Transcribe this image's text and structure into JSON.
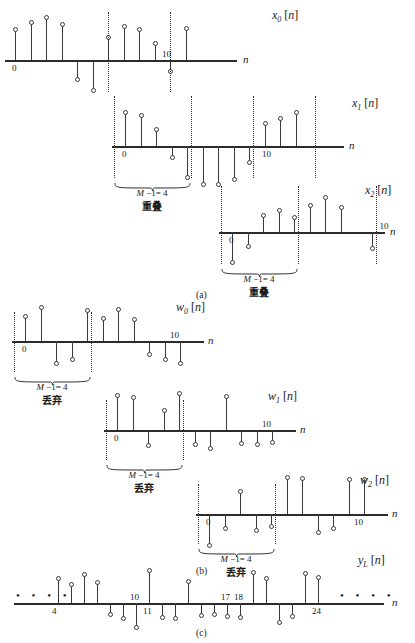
{
  "figure": {
    "axis_variable": "n",
    "parts": [
      {
        "id": "a",
        "label": "(a)"
      },
      {
        "id": "b",
        "label": "(b)"
      },
      {
        "id": "c",
        "label": "(c)"
      }
    ],
    "bracket_label": "M −1= 4",
    "overlap_text": "重叠",
    "discard_text": "丢弃"
  },
  "signals": {
    "x0": {
      "name": "x",
      "sub": "0",
      "arg": "[n]",
      "origin_tick": "0",
      "tick10": "10"
    },
    "x1": {
      "name": "x",
      "sub": "1",
      "arg": "[n]",
      "origin_tick": "0",
      "tick10": "10"
    },
    "x2": {
      "name": "x",
      "sub": "2",
      "arg": "[n]",
      "origin_tick": "0",
      "tick10": "10"
    },
    "w0": {
      "name": "w",
      "sub": "0",
      "arg": "[n]",
      "origin_tick": "0",
      "tick10": "10"
    },
    "w1": {
      "name": "w",
      "sub": "1",
      "arg": "[n]",
      "origin_tick": "0",
      "tick10": "10"
    },
    "w2": {
      "name": "w",
      "sub": "2",
      "arg": "[n]",
      "origin_tick": "0",
      "tick10": "10"
    },
    "yL": {
      "name": "y",
      "sub": "L",
      "arg": "[n]"
    }
  },
  "chart_data": {
    "type": "line",
    "xlabel": "n",
    "ylabel": "",
    "grid": false,
    "legend": "none",
    "panels": [
      {
        "part": "a",
        "series": [
          {
            "name": "x0[n]",
            "x": [
              0,
              1,
              2,
              3,
              4,
              5,
              6,
              7,
              8,
              9,
              10,
              11
            ],
            "values": [
              2.6,
              3.3,
              3.7,
              3.1,
              -1.6,
              -2.6,
              1.9,
              2.9,
              2.6,
              1.4,
              -0.9,
              2.7
            ],
            "annotations": [
              "0",
              "10"
            ],
            "dotted_markers": [
              6,
              10
            ]
          }
        ]
      },
      {
        "part": "a",
        "series": [
          {
            "name": "x1[n]",
            "x": [
              0,
              1,
              2,
              3,
              4,
              5,
              6,
              7,
              8,
              9,
              10,
              11
            ],
            "values": [
              2.9,
              2.6,
              1.4,
              -0.9,
              -2.7,
              -3.4,
              -3.4,
              -2.9,
              -1.4,
              1.9,
              2.4,
              2.9
            ],
            "annotations": [
              "0",
              "10"
            ],
            "dotted_markers": [
              -1,
              4,
              8,
              12
            ]
          }
        ]
      },
      {
        "part": "a",
        "series": [
          {
            "name": "x2[n]",
            "x": [
              0,
              1,
              2,
              3,
              4,
              5,
              6,
              7,
              8,
              9,
              10
            ],
            "values": [
              -2.6,
              -1.2,
              1.4,
              1.8,
              1.2,
              2.3,
              3.0,
              2.1,
              0.0,
              -1.4,
              0.0
            ],
            "annotations": [
              "0",
              "10"
            ],
            "dotted_markers": [
              -1,
              4,
              9
            ]
          }
        ]
      },
      {
        "part": "b",
        "series": [
          {
            "name": "w0[n]",
            "x": [
              0,
              1,
              2,
              3,
              4,
              5,
              6,
              7,
              8,
              9,
              10,
              11
            ],
            "values": [
              2.1,
              2.9,
              -1.9,
              -1.5,
              2.6,
              1.9,
              2.7,
              1.8,
              -1.1,
              -1.5,
              -1.9,
              0.0
            ],
            "annotations": [
              "0",
              "10"
            ],
            "dotted_markers": [
              -1,
              4
            ]
          }
        ]
      },
      {
        "part": "b",
        "series": [
          {
            "name": "w1[n]",
            "x": [
              0,
              1,
              2,
              3,
              4,
              5,
              6,
              7,
              8,
              9,
              10,
              11
            ],
            "values": [
              3.0,
              2.8,
              -1.3,
              1.6,
              3.2,
              -1.2,
              -1.5,
              2.9,
              -1.1,
              -1.2,
              -1.0,
              0.0
            ],
            "annotations": [
              "0",
              "10"
            ],
            "dotted_markers": [
              -1,
              4
            ]
          }
        ]
      },
      {
        "part": "b",
        "series": [
          {
            "name": "w2[n]",
            "x": [
              0,
              1,
              2,
              3,
              4,
              5,
              6,
              7,
              8,
              9,
              10,
              11
            ],
            "values": [
              -2.7,
              -1.2,
              1.9,
              -1.4,
              -1.0,
              3.2,
              3.1,
              -1.5,
              -1.2,
              3.0,
              3.0,
              0.0
            ],
            "annotations": [
              "0",
              "10"
            ],
            "dotted_markers": [
              -1,
              4
            ]
          }
        ]
      },
      {
        "part": "c",
        "series": [
          {
            "name": "yL[n]",
            "x": [
              4,
              5,
              6,
              7,
              8,
              9,
              10,
              11,
              12,
              13,
              14,
              15,
              16,
              17,
              18,
              19,
              20,
              21,
              22,
              23,
              24
            ],
            "values": [
              2.6,
              1.9,
              3.0,
              2.1,
              -1.1,
              -1.5,
              -2.6,
              3.4,
              -1.4,
              -1.5,
              2.2,
              -1.2,
              -1.1,
              -1.3,
              -1.4,
              3.2,
              2.6,
              -2.0,
              -1.3,
              3.1,
              2.7
            ],
            "annotations": [
              "4",
              "10",
              "11",
              "17",
              "18",
              "24"
            ],
            "left_ellipsis": "• • • •",
            "right_ellipsis": "• • • •"
          }
        ]
      }
    ]
  }
}
